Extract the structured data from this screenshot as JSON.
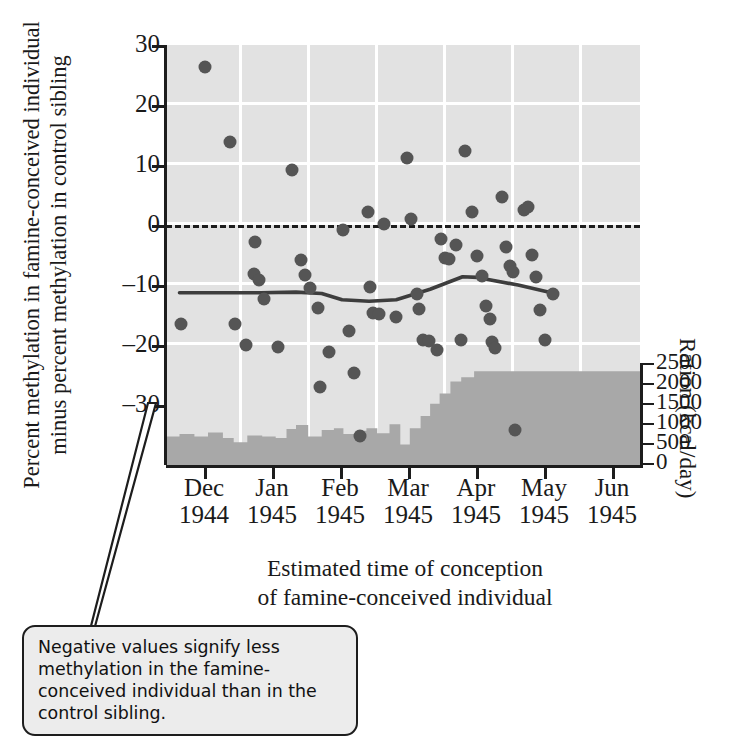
{
  "axes": {
    "y_left_title_lines": [
      "Percent methylation in famine-conceived individual",
      "minus percent methylation in control sibling"
    ],
    "y_left_ticks": [
      "30",
      "20",
      "10",
      "0",
      "–10",
      "–20",
      "–30"
    ],
    "y_right_title": "Ration (kcal/day)",
    "y_right_ticks": [
      "2500",
      "2000",
      "1500",
      "1000",
      "500",
      "0"
    ],
    "x_title_lines": [
      "Estimated time of conception",
      "of famine-conceived individual"
    ],
    "x_ticks": [
      {
        "month": "Dec",
        "year": "1944"
      },
      {
        "month": "Jan",
        "year": "1945"
      },
      {
        "month": "Feb",
        "year": "1945"
      },
      {
        "month": "Mar",
        "year": "1945"
      },
      {
        "month": "Apr",
        "year": "1945"
      },
      {
        "month": "May",
        "year": "1945"
      },
      {
        "month": "Jun",
        "year": "1945"
      }
    ]
  },
  "callout": {
    "text": "Negative values signify less methylation in the famine-conceived individual than in the control sibling."
  },
  "colors": {
    "plot_background": "#e2e2e2",
    "gridline": "#ffffff",
    "point": "#555555",
    "ration_fill": "#a8a8a8",
    "trend_line": "#3d3d3d",
    "axis": "#1d1d1d",
    "callout_fill": "#ececec"
  },
  "chart_data": {
    "type": "scatter",
    "title": "",
    "xlabel": "Estimated time of conception of famine-conceived individual",
    "ylabel": "Percent methylation in famine-conceived individual minus percent methylation in control sibling",
    "ylabel_right": "Ration (kcal/day)",
    "xlim": [
      0,
      7
    ],
    "ylim": [
      -30,
      30
    ],
    "ylim_right": [
      0,
      2500
    ],
    "grid": true,
    "legend": false,
    "x_tick_positions": [
      0.5,
      1.5,
      2.5,
      3.5,
      4.5,
      5.5,
      6.5
    ],
    "x_tick_labels": [
      "Dec 1944",
      "Jan 1945",
      "Feb 1945",
      "Mar 1945",
      "Apr 1945",
      "May 1945",
      "Jun 1945"
    ],
    "y_ticks": [
      30,
      20,
      10,
      0,
      -10,
      -20,
      -30
    ],
    "y_ticks_right": [
      0,
      500,
      1000,
      1500,
      2000,
      2500
    ],
    "reference_line": {
      "y": 0,
      "style": "dashed",
      "label": "no difference"
    },
    "series": [
      {
        "name": "Methylation difference (famine minus control)",
        "type": "scatter",
        "points": [
          [
            0.22,
            -9.8
          ],
          [
            0.58,
            26.9
          ],
          [
            0.95,
            16.2
          ],
          [
            1.02,
            -9.9
          ],
          [
            1.18,
            -12.9
          ],
          [
            1.3,
            -2.7
          ],
          [
            1.38,
            -3.5
          ],
          [
            1.32,
            1.9
          ],
          [
            1.44,
            -6.3
          ],
          [
            1.66,
            -13.2
          ],
          [
            1.86,
            12.2
          ],
          [
            2.0,
            -0.7
          ],
          [
            2.05,
            -2.9
          ],
          [
            2.12,
            -4.7
          ],
          [
            2.24,
            -7.5
          ],
          [
            2.28,
            -18.9
          ],
          [
            2.4,
            -13.8
          ],
          [
            2.62,
            3.6
          ],
          [
            2.7,
            -10.8
          ],
          [
            2.78,
            -16.9
          ],
          [
            2.86,
            -25.9
          ],
          [
            2.98,
            6.2
          ],
          [
            3.02,
            -4.6
          ],
          [
            3.06,
            -8.3
          ],
          [
            3.14,
            -8.4
          ],
          [
            3.22,
            4.4
          ],
          [
            3.4,
            -8.9
          ],
          [
            3.56,
            13.8
          ],
          [
            3.62,
            5.1
          ],
          [
            3.7,
            -5.6
          ],
          [
            3.74,
            -7.7
          ],
          [
            3.8,
            -12.1
          ],
          [
            3.88,
            -12.3
          ],
          [
            4.0,
            -13.6
          ],
          [
            4.06,
            2.3
          ],
          [
            4.12,
            -0.4
          ],
          [
            4.18,
            -0.6
          ],
          [
            4.28,
            1.4
          ],
          [
            4.36,
            -12.2
          ],
          [
            4.42,
            14.8
          ],
          [
            4.52,
            6.1
          ],
          [
            4.6,
            -0.2
          ],
          [
            4.66,
            -3.0
          ],
          [
            4.72,
            -7.3
          ],
          [
            4.78,
            -9.2
          ],
          [
            4.82,
            -12.4
          ],
          [
            4.86,
            -13.3
          ],
          [
            4.96,
            8.3
          ],
          [
            5.02,
            1.2
          ],
          [
            5.08,
            -1.6
          ],
          [
            5.12,
            -2.4
          ],
          [
            5.16,
            -25.0
          ],
          [
            5.28,
            6.5
          ],
          [
            5.34,
            6.8
          ],
          [
            5.4,
            0.0
          ],
          [
            5.46,
            -3.2
          ],
          [
            5.52,
            -7.9
          ],
          [
            5.6,
            -12.1
          ],
          [
            5.72,
            -5.6
          ]
        ]
      },
      {
        "name": "Smoothed trend",
        "type": "line",
        "points": [
          [
            0.2,
            -5.4
          ],
          [
            1.4,
            -5.4
          ],
          [
            1.92,
            -5.3
          ],
          [
            2.3,
            -5.5
          ],
          [
            2.6,
            -6.4
          ],
          [
            3.0,
            -6.6
          ],
          [
            3.4,
            -6.4
          ],
          [
            3.9,
            -4.9
          ],
          [
            4.38,
            -3.1
          ],
          [
            4.6,
            -3.2
          ],
          [
            5.2,
            -4.3
          ],
          [
            5.74,
            -5.5
          ]
        ]
      },
      {
        "name": "Official daily ration",
        "type": "step-area",
        "axis": "right",
        "steps": [
          [
            0.0,
            700
          ],
          [
            0.2,
            760
          ],
          [
            0.42,
            700
          ],
          [
            0.62,
            800
          ],
          [
            0.84,
            660
          ],
          [
            1.0,
            560
          ],
          [
            1.2,
            720
          ],
          [
            1.42,
            700
          ],
          [
            1.62,
            660
          ],
          [
            1.78,
            880
          ],
          [
            1.92,
            980
          ],
          [
            2.1,
            700
          ],
          [
            2.3,
            860
          ],
          [
            2.48,
            900
          ],
          [
            2.62,
            760
          ],
          [
            2.8,
            840
          ],
          [
            2.96,
            900
          ],
          [
            3.12,
            780
          ],
          [
            3.3,
            1000
          ],
          [
            3.46,
            500
          ],
          [
            3.6,
            900
          ],
          [
            3.76,
            1200
          ],
          [
            3.9,
            1500
          ],
          [
            4.04,
            1750
          ],
          [
            4.2,
            2050
          ],
          [
            4.36,
            2150
          ],
          [
            4.55,
            2300
          ]
        ]
      }
    ]
  }
}
